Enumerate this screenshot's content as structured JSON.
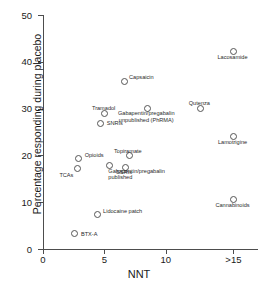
{
  "chart_data": {
    "type": "scatter",
    "title": "",
    "xlabel": "NNT",
    "ylabel": "Percentage responding during placebo",
    "xlim": [
      0,
      17.5
    ],
    "ylim": [
      0,
      50
    ],
    "grid": false,
    "legend": "none",
    "xticks": [
      "0",
      "5",
      "10",
      ">15"
    ],
    "xtick_values": [
      0,
      5,
      10,
      15.5
    ],
    "yticks": [
      "0",
      "10",
      "20",
      "30",
      "40",
      "50"
    ],
    "ytick_values": [
      0,
      10,
      20,
      30,
      40,
      50
    ],
    "points": [
      {
        "label": "BTX-A",
        "x": 2.6,
        "y": 3.3,
        "lx": 6,
        "ly": -3,
        "align": "left"
      },
      {
        "label": "TCAs",
        "x": 2.8,
        "y": 17.1,
        "lx": -2,
        "ly": 7,
        "align": "right"
      },
      {
        "label": "Opioids",
        "x": 2.9,
        "y": 19.3,
        "lx": 6,
        "ly": -7,
        "align": "left"
      },
      {
        "label": "Lidocaine patch",
        "x": 4.4,
        "y": 7.3,
        "lx": 6,
        "ly": -7,
        "align": "left"
      },
      {
        "label": "SNRIs",
        "x": 4.7,
        "y": 26.8,
        "lx": 6,
        "ly": 0,
        "align": "left"
      },
      {
        "label": "Tramadol",
        "x": 5.0,
        "y": 29.0,
        "lx": -1,
        "ly": -9,
        "align": "center"
      },
      {
        "label": "Gabapentin/pregabalin\npublished",
        "x": 5.4,
        "y": 17.8,
        "lx": -1,
        "ly": 6,
        "align": "left"
      },
      {
        "label": "SSRIs",
        "x": 6.7,
        "y": 17.5,
        "lx": -1,
        "ly": 6,
        "align": "center"
      },
      {
        "label": "Topiramate",
        "x": 7.0,
        "y": 19.9,
        "lx": -1,
        "ly": -9,
        "align": "center"
      },
      {
        "label": "Capsaicin",
        "x": 6.6,
        "y": 35.7,
        "lx": 5,
        "ly": -8,
        "align": "left"
      },
      {
        "label": "Gabapentin/pregabalin\nunpublished (PhRMA)",
        "x": 8.5,
        "y": 30.1,
        "lx": -1,
        "ly": 6,
        "align": "center"
      },
      {
        "label": "Qutenza",
        "x": 12.8,
        "y": 30.1,
        "lx": -1,
        "ly": -9,
        "align": "center"
      },
      {
        "label": "Lacosamide",
        "x": 15.5,
        "y": 42.2,
        "lx": -1,
        "ly": 6,
        "align": "center"
      },
      {
        "label": "Lamotrigine",
        "x": 15.5,
        "y": 24.0,
        "lx": -1,
        "ly": 6,
        "align": "center"
      },
      {
        "label": "Cannabinoids",
        "x": 15.5,
        "y": 10.5,
        "lx": -1,
        "ly": 6,
        "align": "center"
      }
    ]
  },
  "style": {
    "axis_color": "#4d4d4d",
    "marker_color": "#555555",
    "text_color": "#1a1a1a",
    "background": "#ffffff"
  }
}
